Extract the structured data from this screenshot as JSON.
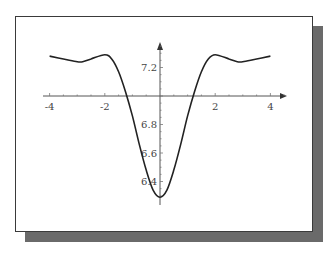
{
  "chart_data": {
    "type": "line",
    "title": "",
    "xlabel": "",
    "ylabel": "",
    "x_ticks": [
      "-4",
      "-2",
      "2",
      "4"
    ],
    "y_ticks": [
      "7.2",
      "6.8",
      "6.6",
      "6.4"
    ],
    "xlim": [
      -4.2,
      4.7
    ],
    "ylim": [
      6.2,
      7.45
    ],
    "axis_crossing": {
      "x": 0,
      "y": 7.0
    },
    "grid": false,
    "legend": null,
    "series": [
      {
        "name": "f(x)",
        "x": [
          -4,
          -3.5,
          -3,
          -2.8,
          -2.5,
          -2,
          -1.75,
          -1.5,
          -1.25,
          -1,
          -0.75,
          -0.5,
          -0.25,
          0,
          0.25,
          0.5,
          0.75,
          1,
          1.25,
          1.5,
          1.75,
          2,
          2.5,
          2.8,
          3,
          3.5,
          4
        ],
        "values": [
          7.28,
          7.26,
          7.24,
          7.24,
          7.26,
          7.29,
          7.26,
          7.17,
          7.03,
          6.86,
          6.66,
          6.48,
          6.34,
          6.29,
          6.34,
          6.48,
          6.66,
          6.86,
          7.03,
          7.17,
          7.26,
          7.29,
          7.26,
          7.24,
          7.24,
          7.26,
          7.28
        ]
      }
    ]
  }
}
